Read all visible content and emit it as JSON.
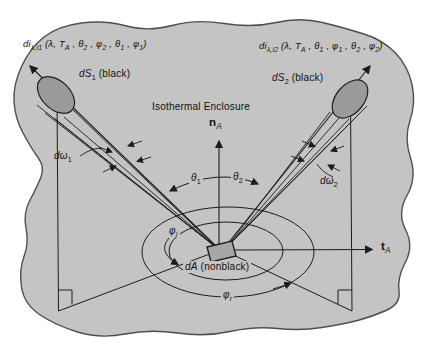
{
  "figure": {
    "enclosure_label": "Isothermal Enclosure"
  },
  "colors": {
    "page_bg": "#ffffff",
    "enclosure_fill": "#c4c4c4",
    "enclosure_stroke": "#4f4f4f",
    "element_fill": "#9a9a9a",
    "element_stroke": "#1f1f1f",
    "da_fill": "#a6a6a6",
    "line": "#1c1c1c",
    "text": "#111111"
  },
  "labels": {
    "intensity1": [
      {
        "t": "di"
      },
      {
        "t": "λ,i1",
        "sub": true
      },
      {
        "t": " (λ, T"
      },
      {
        "t": "A",
        "sub": true
      },
      {
        "t": " , θ"
      },
      {
        "t": "2",
        "sub": true
      },
      {
        "t": " , φ"
      },
      {
        "t": "2",
        "sub": true
      },
      {
        "t": " , θ"
      },
      {
        "t": "1",
        "sub": true
      },
      {
        "t": " , φ"
      },
      {
        "t": "1",
        "sub": true
      },
      {
        "t": ")"
      }
    ],
    "intensity2": [
      {
        "t": "di"
      },
      {
        "t": "λ,i2",
        "sub": true
      },
      {
        "t": " (λ, T"
      },
      {
        "t": "A",
        "sub": true
      },
      {
        "t": " , θ"
      },
      {
        "t": "1",
        "sub": true
      },
      {
        "t": " , φ"
      },
      {
        "t": "1",
        "sub": true
      },
      {
        "t": " , θ"
      },
      {
        "t": "2",
        "sub": true
      },
      {
        "t": " , φ"
      },
      {
        "t": "2",
        "sub": true
      },
      {
        "t": ")"
      }
    ],
    "ds1": [
      {
        "t": "dS",
        "i": true
      },
      {
        "t": "1",
        "sub": true
      },
      {
        "t": " (black)"
      }
    ],
    "ds2": [
      {
        "t": "dS",
        "i": true
      },
      {
        "t": "2",
        "sub": true
      },
      {
        "t": " (black)"
      }
    ],
    "da": [
      {
        "t": "dA",
        "i": true
      },
      {
        "t": " (nonblack)"
      }
    ],
    "enclosure": "Isothermal Enclosure",
    "normal": [
      {
        "t": "n",
        "b": true
      },
      {
        "t": "A",
        "sub": true,
        "i": true
      }
    ],
    "tangent": [
      {
        "t": "t",
        "b": true
      },
      {
        "t": "A",
        "sub": true,
        "i": true
      }
    ],
    "theta1": [
      {
        "t": "θ",
        "i": true
      },
      {
        "t": "1",
        "sub": true
      }
    ],
    "theta2": [
      {
        "t": "θ",
        "i": true
      },
      {
        "t": "2",
        "sub": true
      }
    ],
    "omega1": [
      {
        "t": "dω",
        "i": true
      },
      {
        "t": "1",
        "sub": true
      }
    ],
    "omega2": [
      {
        "t": "dω",
        "i": true
      },
      {
        "t": "2",
        "sub": true
      }
    ],
    "phi_i": [
      {
        "t": "φ",
        "i": true
      },
      {
        "t": "i",
        "sub": true,
        "i": true
      }
    ],
    "phi_r": [
      {
        "t": "φ",
        "i": true
      },
      {
        "t": "r",
        "sub": true,
        "i": true
      }
    ]
  }
}
